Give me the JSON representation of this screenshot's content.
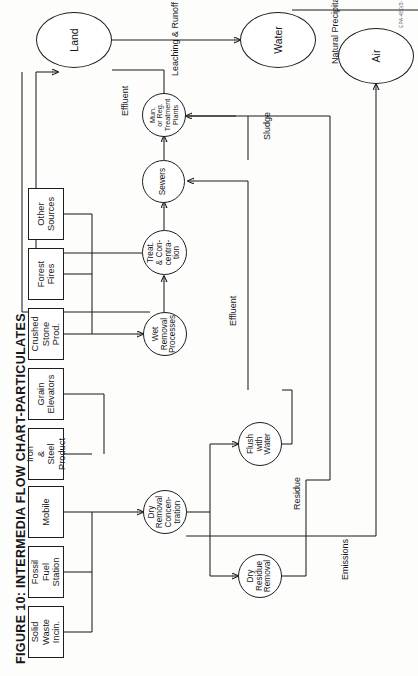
{
  "figure": {
    "title": "FIGURE 10:  INTERMEDIA FLOW CHART-PARTICULATES",
    "footer_code": "EPA-450/3-79-003"
  },
  "sources": [
    {
      "id": "solid-waste-incin",
      "label": "Solid\nWaste\nIncin."
    },
    {
      "id": "fossil-fuel-station",
      "label": "Fossil\nFuel\nStation"
    },
    {
      "id": "mobile",
      "label": "Mobile"
    },
    {
      "id": "iron-steel-product",
      "label": "Iron\n&\nSteel Product"
    },
    {
      "id": "grain-elevators",
      "label": "Grain\nElevators"
    },
    {
      "id": "crushed-stone-prod",
      "label": "Crushed\nStone\nProd."
    },
    {
      "id": "forest-fires",
      "label": "Forest\nFires"
    },
    {
      "id": "other-sources",
      "label": "Other\nSources"
    }
  ],
  "processes": [
    {
      "id": "dry-removal-concentration",
      "label": "Dry\nRemoval\nConcen-\ntration"
    },
    {
      "id": "wet-removal-processes",
      "label": "Wet\nRemoval\nProcesses"
    },
    {
      "id": "flush-with-water",
      "label": "Flush\nwith\nWater"
    },
    {
      "id": "dry-residue-removal",
      "label": "Dry\nResidue\nRemoval"
    },
    {
      "id": "treat-and-concentration",
      "label": "Treat.\n& Con-\ncentra-\ntion"
    },
    {
      "id": "sewers",
      "label": "Sewers"
    },
    {
      "id": "mun-or-reg-treatment-plants",
      "label": "Mun.\nor Reg.\nTreatment\nPlants"
    }
  ],
  "media": [
    {
      "id": "air",
      "label": "Air"
    },
    {
      "id": "water",
      "label": "Water"
    },
    {
      "id": "land",
      "label": "Land"
    }
  ],
  "edge_labels": [
    {
      "id": "emissions",
      "label": "Emissions"
    },
    {
      "id": "residue",
      "label": "Residue"
    },
    {
      "id": "effluent-sewers",
      "label": "Effluent"
    },
    {
      "id": "effluent-treatment",
      "label": "Effluent"
    },
    {
      "id": "sludge",
      "label": "Sludge"
    },
    {
      "id": "leaching-and-runoff",
      "label": "Leaching & Runoff"
    },
    {
      "id": "natural-precipitation",
      "label": "Natural Precipitation"
    }
  ]
}
